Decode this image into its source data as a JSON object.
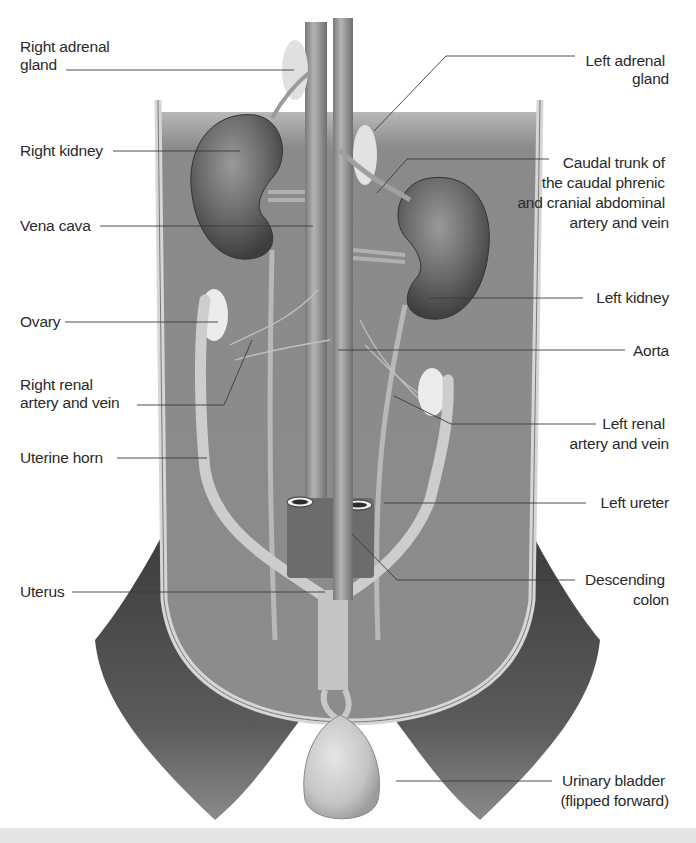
{
  "figure": {
    "colors": {
      "background": "#ffffff",
      "cavity": "#8e8e8e",
      "body_wall": "#4a4a4a",
      "organ_dark": "#5e5e5e",
      "vessel": "#a8a8a8",
      "tract_light": "#c9c9c9",
      "label_text": "#2a2a2a",
      "leader_line": "#3a3a3a"
    },
    "labels_left": [
      {
        "id": "right-adrenal-gland",
        "lines": [
          "Right adrenal",
          "gland"
        ]
      },
      {
        "id": "right-kidney",
        "lines": [
          "Right kidney"
        ]
      },
      {
        "id": "vena-cava",
        "lines": [
          "Vena cava"
        ]
      },
      {
        "id": "ovary",
        "lines": [
          "Ovary"
        ]
      },
      {
        "id": "right-renal-artery-vein",
        "lines": [
          "Right renal",
          "artery and vein"
        ]
      },
      {
        "id": "uterine-horn",
        "lines": [
          "Uterine horn"
        ]
      },
      {
        "id": "uterus",
        "lines": [
          "Uterus"
        ]
      }
    ],
    "labels_right": [
      {
        "id": "left-adrenal-gland",
        "lines": [
          "Left adrenal",
          "gland"
        ]
      },
      {
        "id": "caudal-trunk",
        "lines": [
          "Caudal trunk of",
          "the caudal phrenic",
          "and cranial abdominal",
          "artery and vein"
        ]
      },
      {
        "id": "left-kidney",
        "lines": [
          "Left kidney"
        ]
      },
      {
        "id": "aorta",
        "lines": [
          "Aorta"
        ]
      },
      {
        "id": "left-renal-artery-vein",
        "lines": [
          "Left renal",
          "artery and vein"
        ]
      },
      {
        "id": "left-ureter",
        "lines": [
          "Left ureter"
        ]
      },
      {
        "id": "descending-colon",
        "lines": [
          "Descending",
          "colon"
        ]
      },
      {
        "id": "urinary-bladder",
        "lines": [
          "Urinary bladder",
          "(flipped forward)"
        ]
      }
    ]
  }
}
